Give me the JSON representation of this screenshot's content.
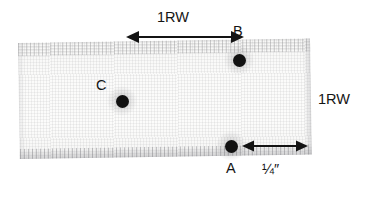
{
  "figure": {
    "type": "fabric-swatch-measurement-diagram",
    "background_color": "#ffffff",
    "swatch_color": "#fafaf9",
    "ink_color": "#141414"
  },
  "swatch": {
    "name": "fabric swatch",
    "description": "light woven fabric rectangle with frayed top and bottom edges"
  },
  "points": [
    {
      "id": "A",
      "label": "A",
      "cx": 231,
      "cy": 146,
      "r": 6.5,
      "label_position": "below"
    },
    {
      "id": "B",
      "label": "B",
      "cx": 239,
      "cy": 60,
      "r": 6.5,
      "label_position": "above"
    },
    {
      "id": "C",
      "label": "C",
      "cx": 122,
      "cy": 101,
      "r": 6.5,
      "label_position": "above-left"
    }
  ],
  "dimensions": [
    {
      "id": "top-horizontal",
      "label": "1RW",
      "orientation": "horizontal",
      "arrow_from_x": 128,
      "arrow_to_x": 241,
      "arrow_y": 37,
      "label_x": 157,
      "label_y": 10
    },
    {
      "id": "right-vertical",
      "label": "1RW",
      "orientation": "vertical-label-only",
      "label_x": 318,
      "label_y": 99
    },
    {
      "id": "bottom-horizontal",
      "label": "¼″",
      "orientation": "horizontal",
      "arrow_from_x": 244,
      "arrow_to_x": 306,
      "arrow_y": 146,
      "label_x": 262,
      "label_y": 166
    }
  ],
  "labels": {
    "top_dimension": "1RW",
    "right_dimension": "1RW",
    "bottom_dimension": "¼″",
    "point_a": "A",
    "point_b": "B",
    "point_c": "C"
  }
}
